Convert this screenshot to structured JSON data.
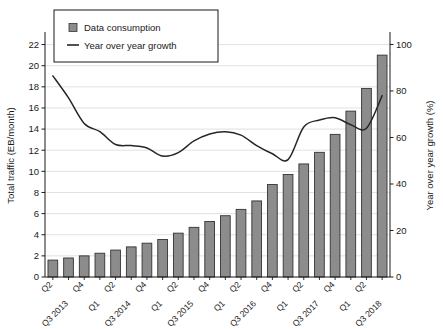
{
  "chart_data": {
    "type": "bar",
    "title": "",
    "xlabel": "",
    "ylabel": "Total traffic (EB/month)",
    "y2label": "Year over year growth (%)",
    "ylim": [
      0,
      23
    ],
    "y2lim": [
      0,
      104.5
    ],
    "yticks": [
      "0",
      "2",
      "4",
      "6",
      "8",
      "10",
      "12",
      "14",
      "16",
      "18",
      "20",
      "22"
    ],
    "y2ticks": [
      "0",
      "20",
      "40",
      "60",
      "80",
      "100"
    ],
    "grid": true,
    "legend_position": "top-left",
    "categories": [
      "Q2",
      "Q3 2013",
      "Q4",
      "Q1",
      "Q2",
      "Q3 2014",
      "Q4",
      "Q1",
      "Q2",
      "Q3 2015",
      "Q4",
      "Q1",
      "Q2",
      "Q3 2016",
      "Q4",
      "Q1",
      "Q2",
      "Q3 2017",
      "Q4",
      "Q1",
      "Q2",
      "Q3 2018"
    ],
    "series": [
      {
        "name": "Data consumption",
        "type": "bar",
        "axis": "left",
        "unit": "EB/month",
        "color": "#8c8c8c",
        "edge_color": "#333333",
        "values": [
          1.6,
          1.8,
          2.0,
          2.25,
          2.55,
          2.85,
          3.2,
          3.55,
          4.15,
          4.7,
          5.25,
          5.8,
          6.4,
          7.2,
          8.75,
          9.7,
          10.7,
          11.8,
          13.5,
          15.7,
          17.85,
          21.0
        ]
      },
      {
        "name": "Year over year growth",
        "type": "line",
        "axis": "right",
        "unit": "%",
        "color": "#262626",
        "values": [
          86.5,
          77.0,
          66.0,
          62.5,
          57.0,
          56.5,
          55.5,
          52.0,
          53.5,
          58.5,
          61.5,
          62.5,
          61.0,
          56.5,
          53.0,
          50.5,
          64.5,
          67.5,
          68.5,
          65.5,
          64.0,
          78.0
        ]
      }
    ]
  },
  "legend": {
    "items": [
      {
        "label": "Data consumption",
        "marker": "square"
      },
      {
        "label": "Year over year growth",
        "marker": "line"
      }
    ]
  }
}
